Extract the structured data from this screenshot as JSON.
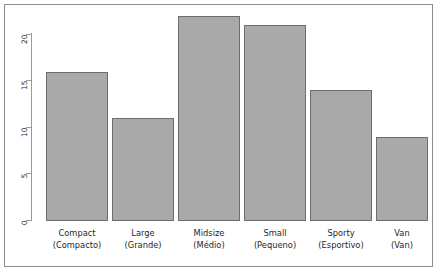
{
  "chart_data": {
    "type": "bar",
    "title": "",
    "subtitle": "",
    "xlabel": "",
    "ylabel": "",
    "categories": [
      "Compact\n(Compacto)",
      "Large\n(Grande)",
      "Midsize\n(Médio)",
      "Small\n(Pequeno)",
      "Sporty\n(Esportivo)",
      "Van\n(Van)"
    ],
    "category_labels_en": [
      "Compact",
      "Large",
      "Midsize",
      "Small",
      "Sporty",
      "Van"
    ],
    "category_labels_pt": [
      "(Compacto)",
      "(Grande)",
      "(Médio)",
      "(Pequeno)",
      "(Esportivo)",
      "(Van)"
    ],
    "values": [
      16,
      11,
      22,
      21,
      14,
      9
    ],
    "ylim": [
      0,
      22.8
    ],
    "yticks": [
      0,
      5,
      10,
      15,
      20
    ],
    "ytick_labels": [
      "0",
      "5",
      "10",
      "15",
      "20"
    ],
    "ytick_label_rotation": -90,
    "grid": false,
    "legend": null,
    "bar_fill_color": "#a9a9a9",
    "bar_border_color": "#6d6d6d",
    "axis_color": "#9a9a9a",
    "frame_color": "#8d8d8d",
    "background_color": "#ffffff"
  },
  "figure": {
    "frame_visible": true,
    "axis_side": "left"
  }
}
